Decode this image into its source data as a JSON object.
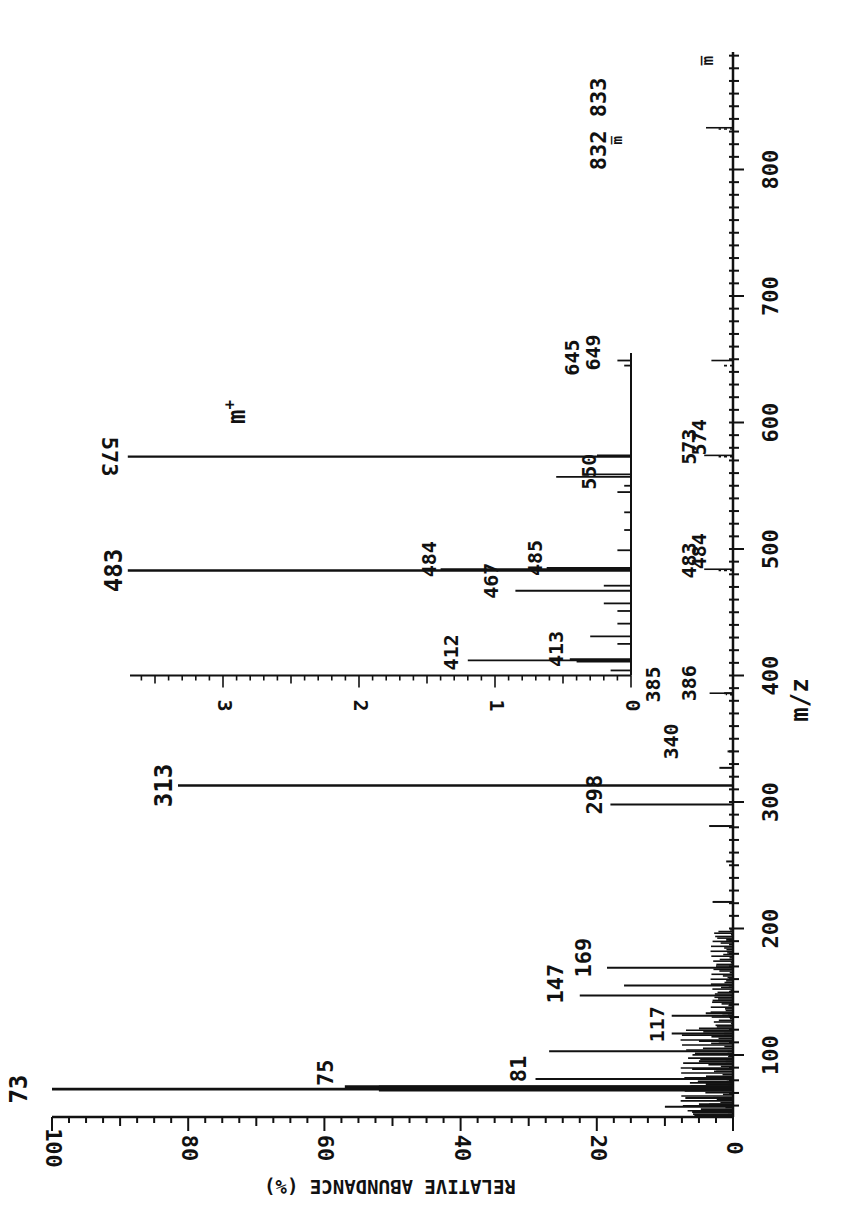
{
  "chart_data": [
    {
      "type": "bar",
      "title": "",
      "orientation": "rotated 90deg (m/z axis vertical on right, abundance axis horizontal at bottom, increasing leftward)",
      "xlabel": "m/z",
      "ylabel": "RELATIVE ABUNDANCE (%)",
      "xlim": [
        50,
        893
      ],
      "ylim": [
        0,
        100
      ],
      "grid": false,
      "x_ticks": [
        100,
        200,
        300,
        400,
        500,
        600,
        700,
        800
      ],
      "y_ticks": [
        0,
        20,
        40,
        60,
        80,
        100
      ],
      "peaks": [
        {
          "mz": 55,
          "value": 6
        },
        {
          "mz": 59,
          "value": 10
        },
        {
          "mz": 61,
          "value": 5
        },
        {
          "mz": 66,
          "value": 7
        },
        {
          "mz": 73,
          "value": 100,
          "label": "73"
        },
        {
          "mz": 74,
          "value": 52
        },
        {
          "mz": 75,
          "value": 57,
          "label": "75",
          "label_style": "tick"
        },
        {
          "mz": 77,
          "value": 4
        },
        {
          "mz": 81,
          "value": 29,
          "label": "81",
          "label_style": "tick"
        },
        {
          "mz": 89,
          "value": 6
        },
        {
          "mz": 95,
          "value": 5
        },
        {
          "mz": 103,
          "value": 27
        },
        {
          "mz": 111,
          "value": 5
        },
        {
          "mz": 117,
          "value": 9,
          "label": "117",
          "label_style": "tick"
        },
        {
          "mz": 121,
          "value": 5
        },
        {
          "mz": 131,
          "value": 9
        },
        {
          "mz": 133,
          "value": 4
        },
        {
          "mz": 143,
          "value": 3
        },
        {
          "mz": 147,
          "value": 22.5,
          "label": "147",
          "label_style": "dot"
        },
        {
          "mz": 155,
          "value": 16
        },
        {
          "mz": 169,
          "value": 18.5,
          "label": "169",
          "label_style": "dot"
        },
        {
          "mz": 191,
          "value": 1
        },
        {
          "mz": 221,
          "value": 3
        },
        {
          "mz": 253,
          "value": 1
        },
        {
          "mz": 281,
          "value": 3.5
        },
        {
          "mz": 298,
          "value": 18,
          "label": "298",
          "label_style": "tick"
        },
        {
          "mz": 313,
          "value": 81.5,
          "label": "313"
        },
        {
          "mz": 327,
          "value": 2
        },
        {
          "mz": 340,
          "value": 0.8,
          "label": "340",
          "label_style": "dash"
        },
        {
          "mz": 385,
          "value": 0.4,
          "label": "385",
          "label_style": "dot"
        },
        {
          "mz": 386,
          "value": 1.3,
          "label": "386",
          "label_style": "tick"
        },
        {
          "mz": 483,
          "value": 0.8,
          "label": "483",
          "label_style": "dash"
        },
        {
          "mz": 484,
          "value": 1.6,
          "label": "484",
          "label_style": "tick"
        },
        {
          "mz": 573,
          "value": 0.8,
          "label": "573",
          "label_style": "dash"
        },
        {
          "mz": 574,
          "value": 1.6,
          "label": "574",
          "label_style": "tick"
        },
        {
          "mz": 645,
          "value": 0.5,
          "label": "645",
          "label_style": "dot"
        },
        {
          "mz": 649,
          "value": 1.2,
          "label": "649",
          "label_style": "tick"
        },
        {
          "mz": 832,
          "value": 0.8,
          "label": "832",
          "label_style": "dash"
        },
        {
          "mz": 833,
          "value": 1.5,
          "label": "833",
          "label_style": "tick"
        }
      ],
      "annotations": [
        "m̅ (near 832)",
        "m̅ (at top of axis, ~886)"
      ]
    },
    {
      "type": "bar",
      "title": "Inset (expanded scale)",
      "xlabel": "m/z",
      "ylabel": "RELATIVE ABUNDANCE (%)",
      "xlim": [
        400,
        650
      ],
      "ylim": [
        0,
        3.7
      ],
      "grid": false,
      "y_ticks": [
        0,
        1,
        2,
        3
      ],
      "peaks": [
        {
          "mz": 404,
          "value": 0.15
        },
        {
          "mz": 411,
          "value": 0.4
        },
        {
          "mz": 412,
          "value": 1.2,
          "label": "412",
          "label_style": "tick"
        },
        {
          "mz": 413,
          "value": 0.45,
          "label": "413",
          "label_style": "tick"
        },
        {
          "mz": 425,
          "value": 0.1
        },
        {
          "mz": 431,
          "value": 0.3
        },
        {
          "mz": 441,
          "value": 0.1
        },
        {
          "mz": 451,
          "value": 0.1
        },
        {
          "mz": 457,
          "value": 0.2
        },
        {
          "mz": 467,
          "value": 0.85,
          "label": "467",
          "label_style": "tick"
        },
        {
          "mz": 471,
          "value": 0.2
        },
        {
          "mz": 483,
          "value": 3.7,
          "label": "483",
          "off_scale": true
        },
        {
          "mz": 484,
          "value": 1.4,
          "label": "484",
          "label_style": "tick"
        },
        {
          "mz": 485,
          "value": 0.62,
          "label": "485",
          "label_style": "tick"
        },
        {
          "mz": 499,
          "value": 0.1
        },
        {
          "mz": 515,
          "value": 0.05
        },
        {
          "mz": 529,
          "value": 0.05
        },
        {
          "mz": 545,
          "value": 0.1
        },
        {
          "mz": 550,
          "value": 0.05,
          "label": "550",
          "label_style": "dash"
        },
        {
          "mz": 557,
          "value": 0.55
        },
        {
          "mz": 559,
          "value": 0.35
        },
        {
          "mz": 573,
          "value": 3.7,
          "label": "573",
          "off_scale": true
        },
        {
          "mz": 574,
          "value": 0.25
        },
        {
          "mz": 645,
          "value": 0.05
        },
        {
          "mz": 649,
          "value": 0.1
        }
      ],
      "annotations": [
        "m⁺ (molecular ion label above 573)"
      ]
    }
  ],
  "axes": {
    "main_y_tick_labels": [
      "100",
      "80",
      "60",
      "40",
      "20",
      "0"
    ],
    "main_x_tick_labels": [
      "100",
      "200",
      "300",
      "400",
      "500",
      "600",
      "700",
      "800"
    ],
    "inset_y_tick_labels": [
      "3",
      "2",
      "1",
      "0"
    ],
    "xlabel": "m/z",
    "ylabel": "RELATIVE   ABUNDANCE (%)",
    "mplus_label": "m",
    "mplus_sup": "+",
    "top_label": "m̅",
    "m832_label": "m̅"
  },
  "colors": {
    "ink": "#111111",
    "background": "#ffffff"
  }
}
